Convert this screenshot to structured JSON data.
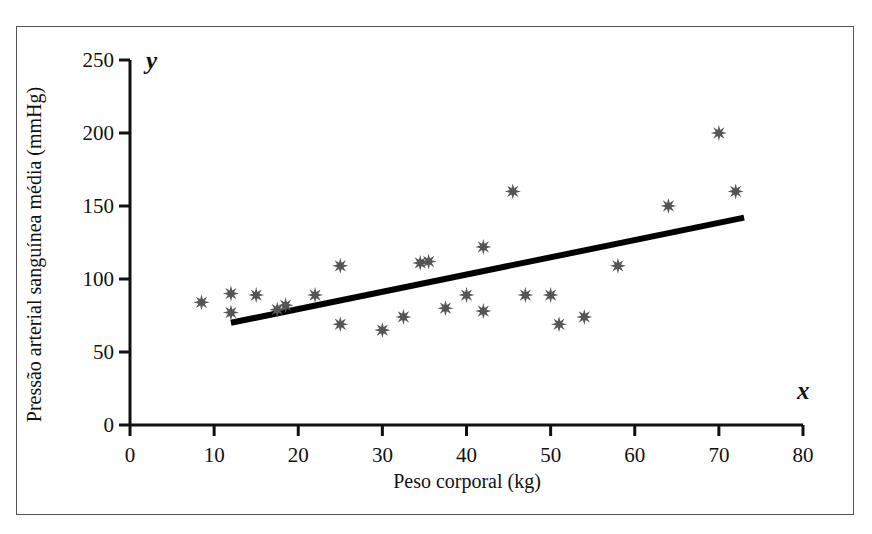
{
  "figure": {
    "background_color": "#ffffff",
    "frame_color": "#555555",
    "caption_fragment": "",
    "axis_letters": {
      "y": "y",
      "x": "x"
    }
  },
  "chart_data": {
    "type": "scatter",
    "title": "",
    "subtitle": "",
    "xlabel": "Peso corporal (kg)",
    "ylabel": "Pressão arterial sanguínea média (mmHg)",
    "xlim": [
      0,
      80
    ],
    "ylim": [
      0,
      250
    ],
    "xticks": [
      0,
      10,
      20,
      30,
      40,
      50,
      60,
      70,
      80
    ],
    "yticks": [
      0,
      50,
      100,
      150,
      200,
      250
    ],
    "xtick_labels": [
      "0",
      "10",
      "20",
      "30",
      "40",
      "50",
      "60",
      "70",
      "80"
    ],
    "ytick_labels": [
      "0",
      "50",
      "100",
      "150",
      "200",
      "250"
    ],
    "grid": false,
    "legend": null,
    "marker": {
      "shape": "eight-point-star",
      "color": "#555555",
      "size": 13
    },
    "points": [
      {
        "x": 8.5,
        "y": 84
      },
      {
        "x": 12.0,
        "y": 90
      },
      {
        "x": 12.0,
        "y": 77
      },
      {
        "x": 15.0,
        "y": 89
      },
      {
        "x": 17.5,
        "y": 79
      },
      {
        "x": 18.5,
        "y": 82
      },
      {
        "x": 22.0,
        "y": 89
      },
      {
        "x": 25.0,
        "y": 109
      },
      {
        "x": 25.0,
        "y": 69
      },
      {
        "x": 30.0,
        "y": 65
      },
      {
        "x": 32.5,
        "y": 74
      },
      {
        "x": 34.5,
        "y": 111
      },
      {
        "x": 35.5,
        "y": 112
      },
      {
        "x": 37.5,
        "y": 80
      },
      {
        "x": 40.0,
        "y": 89
      },
      {
        "x": 42.0,
        "y": 78
      },
      {
        "x": 42.0,
        "y": 122
      },
      {
        "x": 45.5,
        "y": 160
      },
      {
        "x": 47.0,
        "y": 89
      },
      {
        "x": 50.0,
        "y": 89
      },
      {
        "x": 51.0,
        "y": 69
      },
      {
        "x": 54.0,
        "y": 74
      },
      {
        "x": 58.0,
        "y": 109
      },
      {
        "x": 64.0,
        "y": 150
      },
      {
        "x": 70.0,
        "y": 200
      },
      {
        "x": 72.0,
        "y": 160
      }
    ],
    "trendline": {
      "label": "linha de regressão",
      "color": "#000000",
      "width": 6,
      "x_start": 12.0,
      "y_start": 70.0,
      "x_end": 73.0,
      "y_end": 142.0
    }
  }
}
